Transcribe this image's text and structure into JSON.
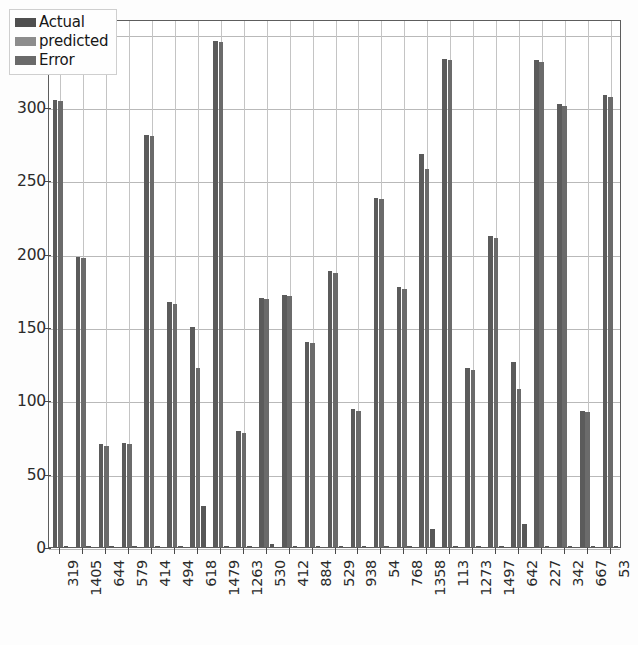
{
  "chart_data": {
    "type": "bar",
    "title": "",
    "xlabel": "",
    "ylabel": "",
    "ylim": [
      0,
      360
    ],
    "yticks": [
      0,
      50,
      100,
      150,
      200,
      250,
      300,
      350
    ],
    "grid": true,
    "legend_position": "upper-left",
    "categories": [
      "319",
      "1405",
      "644",
      "579",
      "414",
      "494",
      "618",
      "1479",
      "1263",
      "530",
      "412",
      "884",
      "529",
      "938",
      "54",
      "768",
      "1358",
      "113",
      "1273",
      "1497",
      "642",
      "227",
      "342",
      "667",
      "53"
    ],
    "series": [
      {
        "name": "Actual",
        "color": "#5b5b5b",
        "values": [
          305,
          198,
          70,
          71,
          281,
          167,
          150,
          345,
          79,
          170,
          172,
          140,
          188,
          94,
          238,
          177,
          268,
          333,
          122,
          212,
          126,
          332,
          302,
          93,
          308
        ]
      },
      {
        "name": "predicted",
        "color": "#6b6b6b",
        "values": [
          304,
          197,
          69,
          70,
          280,
          166,
          122,
          344,
          78,
          169,
          171,
          139,
          187,
          93,
          237,
          176,
          258,
          332,
          121,
          211,
          108,
          331,
          301,
          92,
          307
        ]
      },
      {
        "name": "Error",
        "color": "#575757",
        "values": [
          1,
          1,
          1,
          1,
          1,
          1,
          28,
          1,
          1,
          2,
          1,
          1,
          1,
          1,
          1,
          1,
          12,
          1,
          1,
          1,
          16,
          1,
          1,
          1,
          1
        ]
      }
    ]
  },
  "legend": {
    "items": [
      {
        "label": "Actual",
        "swatch": "legend-swatch-actual"
      },
      {
        "label": "predicted",
        "swatch": "legend-swatch-predicted"
      },
      {
        "label": "Error",
        "swatch": "legend-swatch-error"
      }
    ]
  },
  "axes": {
    "y_tick_labels": [
      "0",
      "50",
      "100",
      "150",
      "200",
      "250",
      "300",
      "350"
    ],
    "x_tick_labels": [
      "319",
      "1405",
      "644",
      "579",
      "414",
      "494",
      "618",
      "1479",
      "1263",
      "530",
      "412",
      "884",
      "529",
      "938",
      "54",
      "768",
      "1358",
      "113",
      "1273",
      "1497",
      "642",
      "227",
      "342",
      "667",
      "53"
    ]
  }
}
